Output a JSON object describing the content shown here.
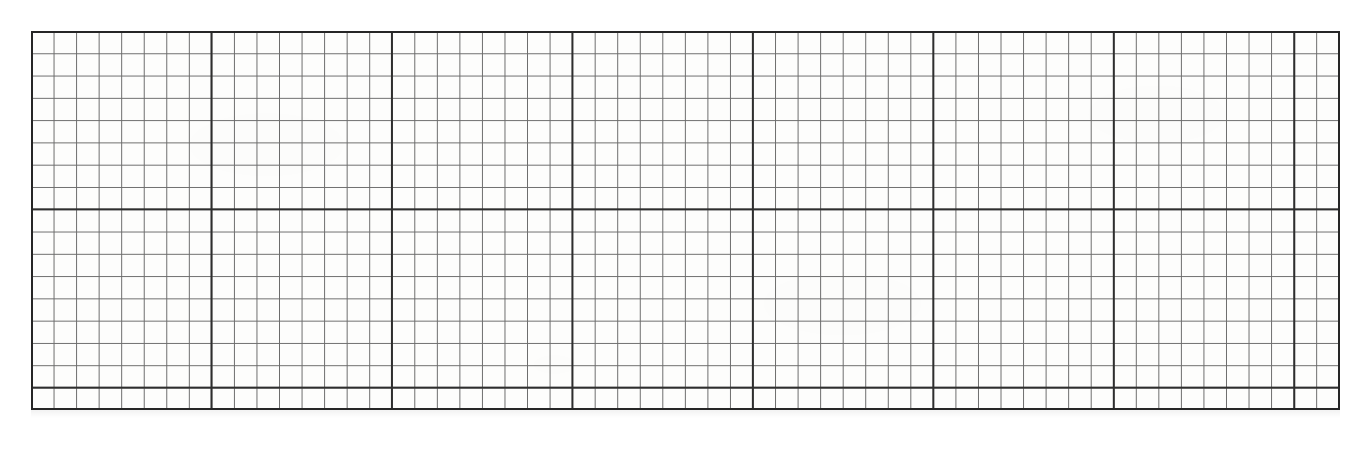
{
  "page": {
    "width": 1370,
    "height": 452,
    "background_color": "#ffffff"
  },
  "grid_sheet": {
    "name": "graph-paper-grid",
    "left": 31,
    "top": 31,
    "right": 1340,
    "bottom": 410,
    "width": 1309,
    "height": 379,
    "paper_color": "#fdfdfc",
    "ink_color": "#3a3a3a",
    "minor_line_color": "#6b6b6b",
    "major_line_color": "#2e2e2e",
    "border_color": "#262626",
    "minor_cell_width": 22.56,
    "minor_cell_height": 22.29,
    "minor_line_width": 1,
    "major_line_width": 2,
    "border_line_width": 2,
    "minor_columns": 58,
    "minor_rows": 17,
    "major_every_columns": 8,
    "major_every_rows": 8
  },
  "chart_data": {
    "type": "table",
    "subtitle": "",
    "xlabel": "",
    "ylabel": "",
    "grid": "on",
    "legend": "none",
    "annotations": [],
    "series": [],
    "categories": [],
    "values": [],
    "xlim": [
      0,
      58
    ],
    "ylim": [
      0,
      17
    ],
    "major_vertical_line_x": [
      31,
      220,
      405,
      594,
      780,
      965,
      1152,
      1340
    ],
    "major_horizontal_line_y": [
      31,
      220,
      410
    ],
    "minor_vertical_spacing_px": 22.56,
    "minor_horizontal_spacing_px": 22.29
  }
}
